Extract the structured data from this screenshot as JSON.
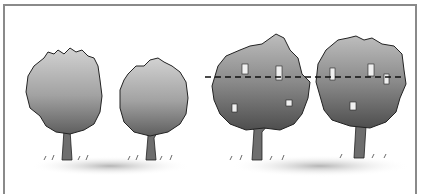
{
  "illustration": {
    "subject": "four-shrubs-pruning-comparison",
    "palette": {
      "foliage_light": "#c9c9c9",
      "foliage_mid": "#8e8e8e",
      "foliage_dark": "#555555",
      "trunk": "#6e6e6e",
      "ground": "#bdbdbd",
      "outline": "#222222",
      "frame": "#8a8a8a",
      "guide_line": "#111111"
    },
    "shrubs": [
      {
        "name": "rounded-shrub-1",
        "style": "dense"
      },
      {
        "name": "rounded-shrub-2",
        "style": "dense"
      },
      {
        "name": "open-shrub-3",
        "style": "open",
        "cut_line": true
      },
      {
        "name": "open-shrub-4",
        "style": "open",
        "cut_line": true
      }
    ]
  }
}
